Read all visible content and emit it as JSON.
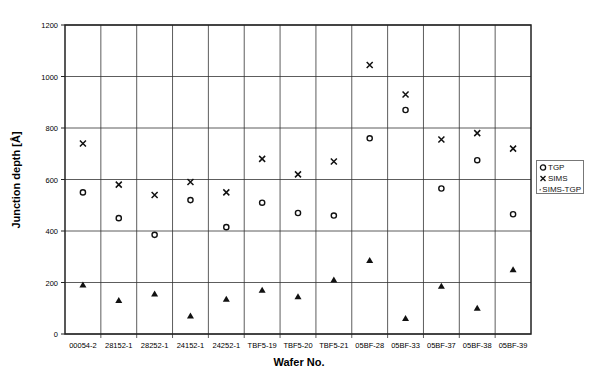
{
  "chart_data": {
    "type": "scatter",
    "title": "",
    "xlabel": "Wafer No.",
    "ylabel": "Junction depth [Å]",
    "ylim": [
      0,
      1200
    ],
    "yticks": [
      0,
      200,
      400,
      600,
      800,
      1000,
      1200
    ],
    "grid": true,
    "legend_position": "right",
    "categories": [
      "00054-2",
      "28152-1",
      "28252-1",
      "24152-1",
      "24252-1",
      "TBF5-19",
      "TBF5-20",
      "TBF5-21",
      "05BF-28",
      "05BF-33",
      "05BF-37",
      "05BF-38",
      "05BF-39"
    ],
    "series": [
      {
        "name": "TGP",
        "marker": "circle-open",
        "values": [
          550,
          450,
          385,
          520,
          415,
          510,
          470,
          460,
          760,
          870,
          565,
          675,
          465
        ]
      },
      {
        "name": "SIMS",
        "marker": "x",
        "values": [
          740,
          580,
          540,
          590,
          550,
          680,
          620,
          670,
          1045,
          930,
          755,
          780,
          720
        ]
      },
      {
        "name": "SIMS-TGP",
        "marker": "triangle-filled",
        "values": [
          190,
          130,
          155,
          70,
          135,
          170,
          145,
          210,
          285,
          60,
          185,
          100,
          250
        ]
      }
    ]
  },
  "legend": {
    "items": [
      {
        "label": "TGP",
        "symbol": "circle-open"
      },
      {
        "label": "SIMS",
        "symbol": "x"
      },
      {
        "label": "SIMS-TGP",
        "symbol": "triangle-filled"
      }
    ]
  }
}
